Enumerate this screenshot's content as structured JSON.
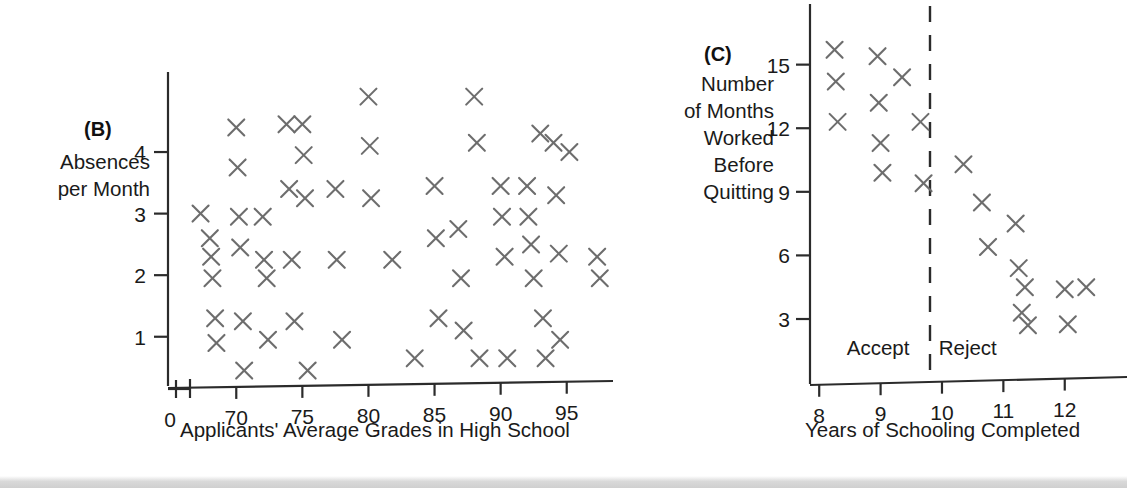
{
  "figure": {
    "background_color": "#ffffff",
    "marker_color": "#6d6d6d",
    "axis_color": "#2b2b2b",
    "marker_glyph": "X"
  },
  "panel_b": {
    "tag": "(B)",
    "y_axis_label_line1": "Absences",
    "y_axis_label_line2": "per Month",
    "x_axis_title": "Applicants' Average Grades in High School",
    "x_tick_zero": "0",
    "x_ticks": [
      "70",
      "75",
      "80",
      "85",
      "90",
      "95"
    ],
    "y_ticks": [
      "4",
      "3",
      "2",
      "1"
    ],
    "axis_break": true
  },
  "panel_c": {
    "tag": "(C)",
    "y_axis_label_lines": [
      "Number",
      "of Months",
      "Worked",
      "Before",
      "Quitting"
    ],
    "x_axis_title": "Years of Schooling Completed",
    "x_ticks": [
      "8",
      "9",
      "10",
      "11",
      "12"
    ],
    "y_ticks": [
      "15",
      "12",
      "9",
      "6",
      "3"
    ],
    "cutoff_label_left": "Accept",
    "cutoff_label_right": "Reject",
    "cutoff_value": 10
  },
  "chart_data": [
    {
      "type": "scatter",
      "id": "B",
      "title": "(B)",
      "xlabel": "Applicants' Average Grades in High School",
      "ylabel": "Absences per Month",
      "xlim": [
        66.5,
        98.5
      ],
      "ylim": [
        0.2,
        5.3
      ],
      "xticks": [
        70,
        75,
        80,
        85,
        90,
        95
      ],
      "yticks": [
        1,
        2,
        3,
        4
      ],
      "grid": false,
      "legend": null,
      "marker": "X",
      "axis_break_x": true,
      "points": [
        [
          67.3,
          3.0
        ],
        [
          68.0,
          2.6
        ],
        [
          68.1,
          2.3
        ],
        [
          68.2,
          1.95
        ],
        [
          68.4,
          1.3
        ],
        [
          68.5,
          0.9
        ],
        [
          70.0,
          4.4
        ],
        [
          70.1,
          3.75
        ],
        [
          70.2,
          2.95
        ],
        [
          70.3,
          2.45
        ],
        [
          70.5,
          1.25
        ],
        [
          70.6,
          0.45
        ],
        [
          72.0,
          2.95
        ],
        [
          72.1,
          2.25
        ],
        [
          72.3,
          1.95
        ],
        [
          72.4,
          0.95
        ],
        [
          73.8,
          4.45
        ],
        [
          74.0,
          3.4
        ],
        [
          74.2,
          2.25
        ],
        [
          74.4,
          1.25
        ],
        [
          75.0,
          4.45
        ],
        [
          75.1,
          3.95
        ],
        [
          75.2,
          3.25
        ],
        [
          75.4,
          0.45
        ],
        [
          77.5,
          3.4
        ],
        [
          77.6,
          2.25
        ],
        [
          78.0,
          0.95
        ],
        [
          80.0,
          4.9
        ],
        [
          80.1,
          4.1
        ],
        [
          80.2,
          3.25
        ],
        [
          81.8,
          2.25
        ],
        [
          83.5,
          0.65
        ],
        [
          85.0,
          3.45
        ],
        [
          85.1,
          2.6
        ],
        [
          85.3,
          1.3
        ],
        [
          86.8,
          2.75
        ],
        [
          87.0,
          1.95
        ],
        [
          87.2,
          1.1
        ],
        [
          88.0,
          4.9
        ],
        [
          88.2,
          4.15
        ],
        [
          88.4,
          0.65
        ],
        [
          90.0,
          3.45
        ],
        [
          90.1,
          2.95
        ],
        [
          90.3,
          2.3
        ],
        [
          90.5,
          0.65
        ],
        [
          92.0,
          3.45
        ],
        [
          92.1,
          2.95
        ],
        [
          92.3,
          2.5
        ],
        [
          92.5,
          1.95
        ],
        [
          93.0,
          4.3
        ],
        [
          93.2,
          1.3
        ],
        [
          93.4,
          0.65
        ],
        [
          94.0,
          4.15
        ],
        [
          94.2,
          3.3
        ],
        [
          94.4,
          2.35
        ],
        [
          94.5,
          0.95
        ],
        [
          95.2,
          4.0
        ],
        [
          97.3,
          2.3
        ],
        [
          97.5,
          1.95
        ]
      ]
    },
    {
      "type": "scatter",
      "id": "C",
      "title": "(C)",
      "xlabel": "Years of Schooling Completed",
      "ylabel": "Number of Months Worked Before Quitting",
      "xlim": [
        7.85,
        12.9
      ],
      "ylim": [
        0.5,
        17.2
      ],
      "xticks": [
        8,
        9,
        10,
        11,
        12
      ],
      "yticks": [
        3,
        6,
        9,
        12,
        15
      ],
      "grid": false,
      "legend": null,
      "marker": "X",
      "annotations": [
        {
          "text": "Accept",
          "x": 9.1,
          "y": 1.6
        },
        {
          "text": "Reject",
          "x": 10.5,
          "y": 1.6
        }
      ],
      "cutoff_line_x": 10,
      "points": [
        [
          8.25,
          15.7
        ],
        [
          8.27,
          14.2
        ],
        [
          8.3,
          12.3
        ],
        [
          8.95,
          15.4
        ],
        [
          8.97,
          13.2
        ],
        [
          9.0,
          11.3
        ],
        [
          9.03,
          9.9
        ],
        [
          9.35,
          14.4
        ],
        [
          9.65,
          12.3
        ],
        [
          9.7,
          9.4
        ],
        [
          10.35,
          10.3
        ],
        [
          10.65,
          8.5
        ],
        [
          10.75,
          6.4
        ],
        [
          11.2,
          7.5
        ],
        [
          11.25,
          5.4
        ],
        [
          11.35,
          4.5
        ],
        [
          11.3,
          3.3
        ],
        [
          11.4,
          2.7
        ],
        [
          12.0,
          4.4
        ],
        [
          12.05,
          2.75
        ],
        [
          12.35,
          4.5
        ]
      ]
    }
  ]
}
